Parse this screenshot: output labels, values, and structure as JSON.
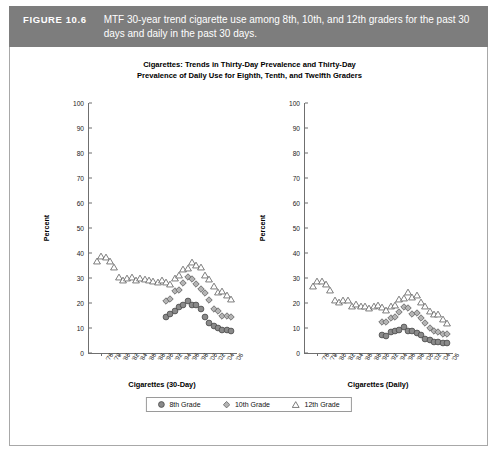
{
  "figure": {
    "label": "FIGURE 10.6",
    "caption": "MTF 30-year trend cigarette use among 8th, 10th, and 12th graders for the past 30 days and daily in the past 30 days."
  },
  "chart_title_line1": "Cigarettes: Trends in Thirty-Day Prevalence and Thirty-Day",
  "chart_title_line2": "Prevalence of Daily Use for Eighth, Tenth, and Twelfth Graders",
  "legend": {
    "items": [
      {
        "label": "8th Grade",
        "marker": "circle-marker",
        "color": "#808080"
      },
      {
        "label": "10th Grade",
        "marker": "diamond-marker",
        "color": "#9a9a9a"
      },
      {
        "label": "12th Grade",
        "marker": "triangle-marker",
        "color": "#ffffff"
      }
    ]
  },
  "chart_data": [
    {
      "type": "scatter",
      "id": "cigarettes-30-day",
      "title": "Cigarettes: Trends in Thirty-Day Prevalence and Thirty-Day Prevalence of Daily Use for Eighth, Tenth, and Twelfth Graders",
      "xlabel": "Cigarettes (30-Day)",
      "ylabel": "Percent",
      "ylim": [
        0,
        100
      ],
      "ytick_labels": [
        "0",
        "10",
        "20",
        "30",
        "40",
        "50",
        "60",
        "70",
        "80",
        "90",
        "100"
      ],
      "ytick_values": [
        0,
        10,
        20,
        30,
        40,
        50,
        60,
        70,
        80,
        90,
        100
      ],
      "grid": false,
      "legend_position": "bottom",
      "x": [
        "'75",
        "'76",
        "'77",
        "'78",
        "'79",
        "'80",
        "'81",
        "'82",
        "'83",
        "'84",
        "'85",
        "'86",
        "'87",
        "'88",
        "'89",
        "'90",
        "'91",
        "'92",
        "'93",
        "'94",
        "'95",
        "'96",
        "'97",
        "'98",
        "'99",
        "'00",
        "'01",
        "'02",
        "'03",
        "'04",
        "'05",
        "'06"
      ],
      "xtick_labels": [
        "'76",
        "'78",
        "'80",
        "'82",
        "'84",
        "'86",
        "'88",
        "'90",
        "'92",
        "'94",
        "'96",
        "'98",
        "'00",
        "'02",
        "'04",
        "'06"
      ],
      "series": [
        {
          "name": "8th Grade",
          "values": [
            null,
            null,
            null,
            null,
            null,
            null,
            null,
            null,
            null,
            null,
            null,
            null,
            null,
            null,
            null,
            null,
            14.3,
            15.5,
            16.7,
            18.6,
            19.1,
            21.0,
            19.4,
            19.1,
            17.5,
            14.6,
            12.2,
            10.7,
            10.2,
            9.2,
            9.3,
            8.7
          ]
        },
        {
          "name": "10th Grade",
          "values": [
            null,
            null,
            null,
            null,
            null,
            null,
            null,
            null,
            null,
            null,
            null,
            null,
            null,
            null,
            null,
            null,
            20.8,
            21.5,
            24.7,
            25.4,
            27.9,
            30.4,
            29.8,
            27.6,
            25.7,
            23.9,
            21.3,
            17.7,
            16.7,
            14.9,
            14.9,
            14.5
          ]
        },
        {
          "name": "12th Grade",
          "values": [
            36.7,
            38.8,
            38.4,
            36.7,
            34.4,
            30.5,
            29.4,
            30.0,
            30.3,
            29.3,
            30.1,
            29.6,
            29.4,
            28.7,
            28.6,
            29.4,
            28.3,
            27.8,
            29.9,
            31.2,
            33.5,
            34.0,
            36.5,
            35.1,
            34.6,
            31.4,
            29.5,
            26.7,
            24.4,
            25.0,
            23.2,
            21.6
          ]
        }
      ]
    },
    {
      "type": "scatter",
      "id": "cigarettes-daily",
      "xlabel": "Cigarettes (Daily)",
      "ylabel": "Percent",
      "ylim": [
        0,
        100
      ],
      "ytick_labels": [
        "0",
        "10",
        "20",
        "30",
        "40",
        "50",
        "60",
        "70",
        "80",
        "90",
        "100"
      ],
      "ytick_values": [
        0,
        10,
        20,
        30,
        40,
        50,
        60,
        70,
        80,
        90,
        100
      ],
      "grid": false,
      "x": [
        "'75",
        "'76",
        "'77",
        "'78",
        "'79",
        "'80",
        "'81",
        "'82",
        "'83",
        "'84",
        "'85",
        "'86",
        "'87",
        "'88",
        "'89",
        "'90",
        "'91",
        "'92",
        "'93",
        "'94",
        "'95",
        "'96",
        "'97",
        "'98",
        "'99",
        "'00",
        "'01",
        "'02",
        "'03",
        "'04",
        "'05",
        "'06"
      ],
      "xtick_labels": [
        "'76",
        "'78",
        "'80",
        "'82",
        "'84",
        "'86",
        "'88",
        "'90",
        "'92",
        "'94",
        "'96",
        "'98",
        "'00",
        "'02",
        "'04",
        "'06"
      ],
      "series": [
        {
          "name": "8th Grade",
          "values": [
            null,
            null,
            null,
            null,
            null,
            null,
            null,
            null,
            null,
            null,
            null,
            null,
            null,
            null,
            null,
            null,
            7.2,
            7.0,
            8.3,
            8.8,
            9.3,
            10.4,
            9.0,
            8.8,
            8.1,
            7.4,
            5.5,
            5.1,
            4.5,
            4.4,
            4.0,
            4.0
          ]
        },
        {
          "name": "10th Grade",
          "values": [
            null,
            null,
            null,
            null,
            null,
            null,
            null,
            null,
            null,
            null,
            null,
            null,
            null,
            null,
            null,
            null,
            12.6,
            12.3,
            14.2,
            14.6,
            16.3,
            18.3,
            18.0,
            15.8,
            15.9,
            14.0,
            12.2,
            10.1,
            8.9,
            8.3,
            7.5,
            7.6
          ]
        },
        {
          "name": "12th Grade",
          "values": [
            26.9,
            28.8,
            28.8,
            27.5,
            25.4,
            21.3,
            20.3,
            21.1,
            21.2,
            18.7,
            19.5,
            18.7,
            18.7,
            18.1,
            18.9,
            19.1,
            18.5,
            17.2,
            19.0,
            19.4,
            21.6,
            22.2,
            24.6,
            22.4,
            23.1,
            20.6,
            19.0,
            16.9,
            15.8,
            15.6,
            13.6,
            12.2
          ]
        }
      ]
    }
  ]
}
